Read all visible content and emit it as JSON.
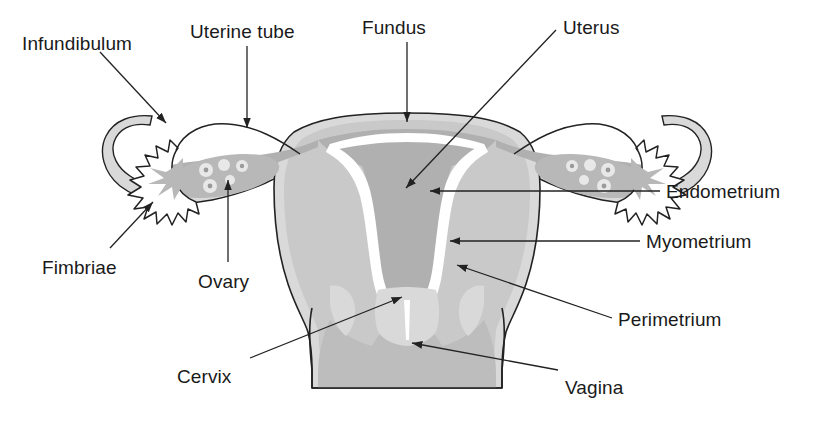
{
  "figure": {
    "background_color": "#ffffff",
    "outline_color": "#222222",
    "text_color": "#1a1a1a"
  },
  "palette": {
    "perimetrium_light": "#d9d9d9",
    "myometrium_mid": "#c9c9c9",
    "endometrium_dark": "#b0b0b0",
    "cavity_white": "#ffffff",
    "ovary_gray": "#b8b8b8",
    "follicle_white": "#e8e8e8",
    "vagina_gray": "#bdbdbd",
    "line": "#222222"
  },
  "labels": [
    {
      "id": "infundibulum",
      "text": "Infundibulum",
      "x": 22,
      "y": 34
    },
    {
      "id": "uterine-tube",
      "text": "Uterine tube",
      "x": 190,
      "y": 22
    },
    {
      "id": "fundus",
      "text": "Fundus",
      "x": 362,
      "y": 18
    },
    {
      "id": "uterus",
      "text": "Uterus",
      "x": 563,
      "y": 18
    },
    {
      "id": "endometrium",
      "text": "Endometrium",
      "x": 666,
      "y": 182
    },
    {
      "id": "myometrium",
      "text": "Myometrium",
      "x": 646,
      "y": 232
    },
    {
      "id": "perimetrium",
      "text": "Perimetrium",
      "x": 618,
      "y": 310
    },
    {
      "id": "fimbriae",
      "text": "Fimbriae",
      "x": 42,
      "y": 258
    },
    {
      "id": "ovary",
      "text": "Ovary",
      "x": 198,
      "y": 272
    },
    {
      "id": "cervix",
      "text": "Cervix",
      "x": 177,
      "y": 367
    },
    {
      "id": "vagina",
      "text": "Vagina",
      "x": 565,
      "y": 378
    }
  ],
  "leaders": [
    {
      "id": "leader-infundibulum",
      "from": [
        100,
        52
      ],
      "to": [
        168,
        125
      ],
      "arrow": true
    },
    {
      "id": "leader-uterine-tube",
      "from": [
        247,
        46
      ],
      "to": [
        247,
        130
      ],
      "arrow": true
    },
    {
      "id": "leader-fundus",
      "from": [
        407,
        42
      ],
      "to": [
        407,
        124
      ],
      "arrow": true
    },
    {
      "id": "leader-uterus",
      "from": [
        556,
        30
      ],
      "to": [
        404,
        190
      ],
      "arrow": true
    },
    {
      "id": "leader-endometrium",
      "from": [
        660,
        191
      ],
      "to": [
        428,
        191
      ],
      "arrow": true
    },
    {
      "id": "leader-myometrium",
      "from": [
        640,
        241
      ],
      "to": [
        448,
        241
      ],
      "arrow": true
    },
    {
      "id": "leader-perimetrium",
      "from": [
        612,
        318
      ],
      "to": [
        455,
        264
      ],
      "arrow": true
    },
    {
      "id": "leader-fimbriae",
      "from": [
        110,
        248
      ],
      "to": [
        152,
        200
      ],
      "arrow": true
    },
    {
      "id": "leader-ovary",
      "from": [
        228,
        262
      ],
      "to": [
        228,
        178
      ],
      "arrow": true
    },
    {
      "id": "leader-cervix",
      "from": [
        250,
        358
      ],
      "to": [
        404,
        296
      ],
      "arrow": true
    },
    {
      "id": "leader-vagina",
      "from": [
        558,
        370
      ],
      "to": [
        410,
        342
      ],
      "arrow": true
    }
  ],
  "structures": [
    {
      "id": "fundus",
      "name": "Fundus"
    },
    {
      "id": "uterus-body",
      "name": "Uterus"
    },
    {
      "id": "uterine-tube-left",
      "name": "Uterine tube (left)"
    },
    {
      "id": "uterine-tube-right",
      "name": "Uterine tube (right)"
    },
    {
      "id": "infundibulum-left",
      "name": "Infundibulum (left)"
    },
    {
      "id": "infundibulum-right",
      "name": "Infundibulum (right)"
    },
    {
      "id": "fimbriae-left",
      "name": "Fimbriae (left)"
    },
    {
      "id": "fimbriae-right",
      "name": "Fimbriae (right)"
    },
    {
      "id": "ovary-left",
      "name": "Ovary (left)"
    },
    {
      "id": "ovary-right",
      "name": "Ovary (right)"
    },
    {
      "id": "endometrium",
      "name": "Endometrium"
    },
    {
      "id": "myometrium",
      "name": "Myometrium"
    },
    {
      "id": "perimetrium",
      "name": "Perimetrium"
    },
    {
      "id": "uterine-cavity",
      "name": "Uterine cavity"
    },
    {
      "id": "cervix",
      "name": "Cervix"
    },
    {
      "id": "vagina",
      "name": "Vagina"
    }
  ]
}
